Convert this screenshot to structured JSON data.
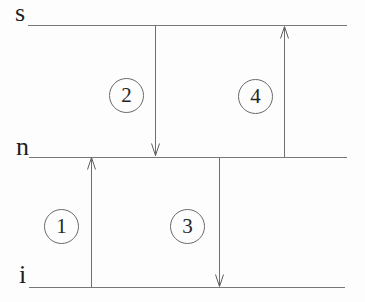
{
  "diagram": {
    "levels": [
      {
        "id": "s",
        "label": "s"
      },
      {
        "id": "n",
        "label": "n"
      },
      {
        "id": "i",
        "label": "i"
      }
    ],
    "transitions": [
      {
        "number": "1",
        "from": "i",
        "to": "n",
        "direction": "up"
      },
      {
        "number": "2",
        "from": "s",
        "to": "n",
        "direction": "down"
      },
      {
        "number": "3",
        "from": "n",
        "to": "i",
        "direction": "down"
      },
      {
        "number": "4",
        "from": "n",
        "to": "s",
        "direction": "up"
      }
    ],
    "colors": {
      "background": "#fdfdfd",
      "line": "#6e6e6e",
      "text": "#1f1f1f"
    }
  }
}
